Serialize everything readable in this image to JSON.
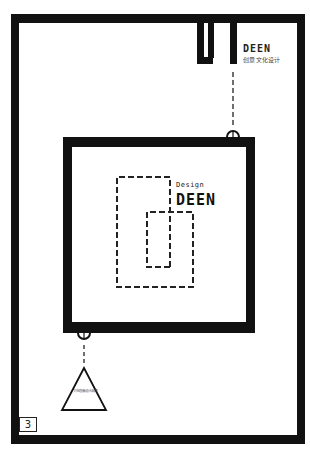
{
  "brand": {
    "logo_title": "DEEN",
    "logo_subtitle": "创意文化设计"
  },
  "center_mark": {
    "tagline": "Design",
    "title": "DEEN"
  },
  "triangle_label": "文化创意设计品牌",
  "page_number": "3",
  "colors": {
    "frame": "#111111",
    "background": "#ffffff",
    "dash": "#222222"
  }
}
